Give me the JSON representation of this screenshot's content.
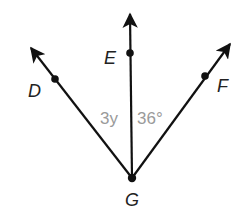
{
  "diagram": {
    "type": "angles-from-common-vertex",
    "vertex": {
      "name": "G",
      "x": 132,
      "y": 178
    },
    "rays": [
      {
        "name": "ray-GD",
        "point": "D",
        "tip": [
          30,
          47
        ],
        "dot": [
          55,
          79
        ]
      },
      {
        "name": "ray-GE",
        "point": "E",
        "tip": [
          130,
          13
        ],
        "dot": [
          130,
          53
        ]
      },
      {
        "name": "ray-GF",
        "point": "F",
        "tip": [
          231,
          43
        ],
        "dot": [
          205,
          76
        ]
      }
    ],
    "labels": {
      "D": "D",
      "E": "E",
      "F": "F",
      "G": "G",
      "angle_DGE": "3y",
      "angle_EGF": "36°"
    },
    "colors": {
      "line": "#111111",
      "point_label": "#222222",
      "angle_label": "#9a9a9a"
    }
  }
}
